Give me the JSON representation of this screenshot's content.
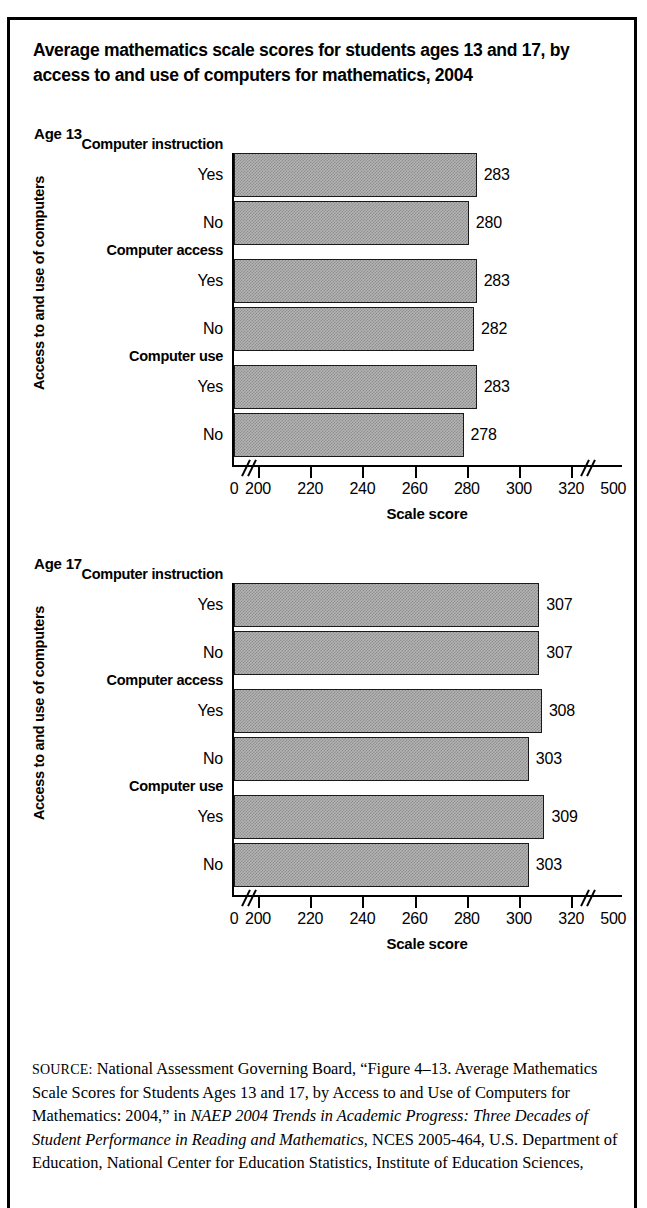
{
  "figure": {
    "title": "Average mathematics scale scores for students ages 13 and 17, by access to and use of computers for mathematics, 2004",
    "xaxis_title": "Scale score",
    "yaxis_title": "Access to and use of computers"
  },
  "source": {
    "label": "SOURCE:",
    "text_part1": " National Assessment Governing Board, “Figure 4–13. Average Mathematics Scale Scores for Students Ages 13 and 17, by Access to and Use of Computers for Mathematics: 2004,” in ",
    "italic1": "NAEP 2004 Trends in Academic Progress: Three Decades of Student Performance in Reading and Mathematics",
    "text_part2": ", NCES 2005-464, U.S. Department of Education, National Center for Education Statistics, Institute of Education Sciences,"
  },
  "chart_data": [
    {
      "type": "bar",
      "orientation": "horizontal",
      "panel_label": "Age 13",
      "title": "Average mathematics scale scores for students ages 13, by access to and use of computers for mathematics, 2004",
      "xlabel": "Scale score",
      "ylabel": "Access to and use of computers",
      "xlim": [
        200,
        320
      ],
      "axis_ticks": [
        "0",
        "200",
        "220",
        "240",
        "260",
        "280",
        "300",
        "320",
        "500"
      ],
      "axis_breaks": [
        "after-0",
        "after-320"
      ],
      "grid": false,
      "legend": "none",
      "groups": [
        {
          "name": "Computer instruction",
          "categories": [
            "Yes",
            "No"
          ],
          "values": [
            283,
            280
          ]
        },
        {
          "name": "Computer access",
          "categories": [
            "Yes",
            "No"
          ],
          "values": [
            283,
            282
          ]
        },
        {
          "name": "Computer use",
          "categories": [
            "Yes",
            "No"
          ],
          "values": [
            283,
            278
          ]
        }
      ],
      "categories": [
        "Yes",
        "No",
        "Yes",
        "No",
        "Yes",
        "No"
      ],
      "values": [
        283,
        280,
        283,
        282,
        283,
        278
      ]
    },
    {
      "type": "bar",
      "orientation": "horizontal",
      "panel_label": "Age 17",
      "title": "Average mathematics scale scores for students ages 17, by access to and use of computers for mathematics, 2004",
      "xlabel": "Scale score",
      "ylabel": "Access to and use of computers",
      "xlim": [
        200,
        320
      ],
      "axis_ticks": [
        "0",
        "200",
        "220",
        "240",
        "260",
        "280",
        "300",
        "320",
        "500"
      ],
      "axis_breaks": [
        "after-0",
        "after-320"
      ],
      "grid": false,
      "legend": "none",
      "groups": [
        {
          "name": "Computer instruction",
          "categories": [
            "Yes",
            "No"
          ],
          "values": [
            307,
            307
          ]
        },
        {
          "name": "Computer access",
          "categories": [
            "Yes",
            "No"
          ],
          "values": [
            308,
            303
          ]
        },
        {
          "name": "Computer use",
          "categories": [
            "Yes",
            "No"
          ],
          "values": [
            309,
            303
          ]
        }
      ],
      "categories": [
        "Yes",
        "No",
        "Yes",
        "No",
        "Yes",
        "No"
      ],
      "values": [
        307,
        307,
        308,
        303,
        309,
        303
      ]
    }
  ]
}
